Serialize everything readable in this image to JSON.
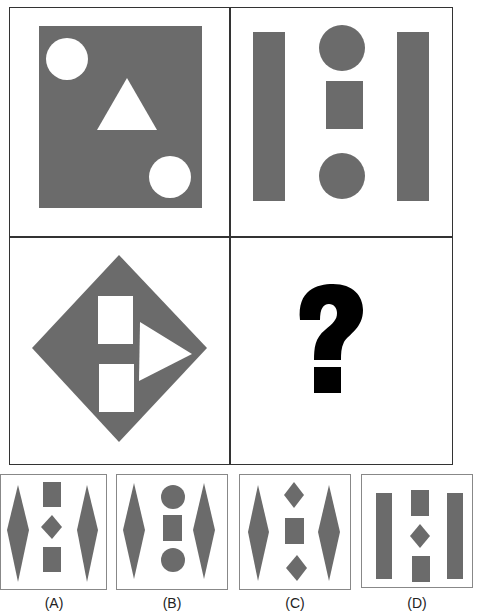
{
  "title": "...",
  "colors": {
    "shape": "#6b6b6b",
    "hole": "#ffffff",
    "border": "#333333",
    "question": "#000000"
  },
  "matrix": {
    "cells": [
      {
        "position": "top-left",
        "description": "Gray square containing two white circles (top-left, bottom-right) and a white upward triangle in center"
      },
      {
        "position": "top-right",
        "description": "Two tall gray bars on the sides; center column: circle, rectangle, circle"
      },
      {
        "position": "bottom-left",
        "description": "Gray diamond containing two white rectangles stacked and a white right-pointing triangle"
      },
      {
        "position": "bottom-right",
        "description": "Question mark",
        "symbol": "?"
      }
    ]
  },
  "options": [
    {
      "label": "(A)",
      "description": "Two tall diamonds on sides; center: rectangle, small diamond, rectangle"
    },
    {
      "label": "(B)",
      "description": "Two tall diamonds on sides; center: circle, rectangle, circle"
    },
    {
      "label": "(C)",
      "description": "Two tall diamonds on sides; center: small diamond, rectangle, small diamond"
    },
    {
      "label": "(D)",
      "description": "Two tall bars on sides; center: rectangle, small diamond, rectangle"
    }
  ]
}
